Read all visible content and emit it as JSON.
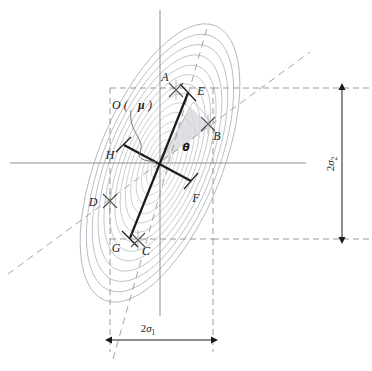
{
  "figure": {
    "center_label": "O (",
    "center_label_mu": "μ",
    "center_label_close": ")",
    "angle_label": "θ",
    "points": [
      {
        "id": "A",
        "label": "A",
        "x": 176,
        "y": 90,
        "label_x": 170,
        "label_y": 83,
        "kind": "tick-cross"
      },
      {
        "id": "B",
        "label": "B",
        "x": 208,
        "y": 124,
        "label_x": 216,
        "label_y": 136,
        "kind": "tick-cross"
      },
      {
        "id": "C",
        "label": "C",
        "x": 138,
        "y": 240,
        "label_x": 142,
        "label_y": 252,
        "kind": "tick-cross"
      },
      {
        "id": "D",
        "label": "D",
        "x": 110,
        "y": 201,
        "label_x": 90,
        "label_y": 205,
        "kind": "tick-cross"
      },
      {
        "id": "E",
        "label": "E",
        "x": 188,
        "y": 93,
        "label_x": 196,
        "label_y": 92,
        "kind": "axis-end"
      },
      {
        "id": "F",
        "label": "F",
        "x": 190,
        "y": 181,
        "label_x": 192,
        "label_y": 199,
        "kind": "axis-end"
      },
      {
        "id": "G",
        "label": "G",
        "x": 128,
        "y": 238,
        "label_x": 116,
        "label_y": 250,
        "kind": "axis-end"
      },
      {
        "id": "H",
        "label": "H",
        "x": 124,
        "y": 145,
        "label_x": 110,
        "label_y": 156,
        "kind": "axis-end"
      }
    ],
    "dimensions": [
      {
        "id": "horizontal",
        "label": "2",
        "sub": "σ",
        "sub_index": "1",
        "full": "2σ₁",
        "orientation": "horizontal"
      },
      {
        "id": "vertical",
        "label": "2",
        "sub": "σ",
        "sub_index": "2",
        "full": "2σ₂",
        "orientation": "vertical"
      }
    ],
    "colors": {
      "contour": "#b9bfc4",
      "contour_outer": "#9aa2a8",
      "axis": "#8c8c8c",
      "dashed": "#9a9a9a",
      "principal_axis": "#1a1a1a",
      "sector_fill": "#d8dade",
      "label": "#1a1a1a",
      "background": "#ffffff"
    },
    "geometry": {
      "center_x": 160,
      "center_y": 163,
      "ellipse_rx": 96,
      "ellipse_ry": 50,
      "rotation_deg": -68,
      "contour_count": 14,
      "box_left": 110,
      "box_right": 213,
      "box_top": 88,
      "box_bottom": 239,
      "h_axis_y": 163,
      "v_axis_x": 160
    }
  }
}
